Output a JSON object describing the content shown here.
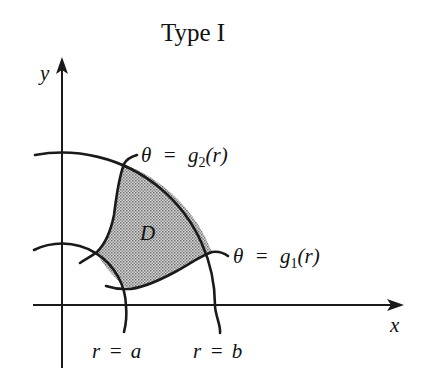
{
  "figure": {
    "title": "Type I",
    "axes": {
      "x_label": "x",
      "y_label": "y"
    },
    "region_label": "D",
    "boundaries": {
      "inner_arc": {
        "lhs": "r",
        "eq": "=",
        "rhs": "a"
      },
      "outer_arc": {
        "lhs": "r",
        "eq": "=",
        "rhs": "b"
      },
      "upper_curve": {
        "lhs": "θ",
        "eq": "=",
        "fn": "g",
        "sub": "2",
        "arg": "(r)"
      },
      "lower_curve": {
        "lhs": "θ",
        "eq": "=",
        "fn": "g",
        "sub": "1",
        "arg": "(r)"
      }
    },
    "colors": {
      "ink": "#1a1a1a",
      "region_fill": "#b8b8b8",
      "background": "#ffffff"
    }
  }
}
